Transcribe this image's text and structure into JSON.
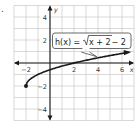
{
  "item_marker": ".",
  "chart_data": {
    "type": "line",
    "title": "",
    "function_label": {
      "lhs": "h(x) = ",
      "radicand": "x + 2",
      "rhs": " − 2"
    },
    "xlabel": "x",
    "ylabel": "y",
    "xlim": [
      -3,
      7
    ],
    "ylim": [
      -5,
      5
    ],
    "x_ticks": [
      {
        "value": -2,
        "label": "−2"
      },
      {
        "value": 2,
        "label": "2"
      },
      {
        "value": 4,
        "label": "4"
      },
      {
        "value": 6,
        "label": "6"
      }
    ],
    "y_ticks": [
      {
        "value": 4,
        "label": "4"
      },
      {
        "value": 2,
        "label": "2"
      },
      {
        "value": -2,
        "label": "−2"
      },
      {
        "value": -4,
        "label": "−4"
      }
    ],
    "grid": true,
    "series": [
      {
        "name": "h(x) = sqrt(x + 2) - 2",
        "start_point": [
          -2,
          -2
        ],
        "x": [
          -2,
          -1.75,
          -1.5,
          -1,
          -0.5,
          0,
          1,
          2,
          3,
          4,
          5,
          6,
          7
        ],
        "values": [
          -2,
          -1.5,
          -1.293,
          -1,
          -0.419,
          -0.586,
          -0.268,
          0,
          0.236,
          0.449,
          0.646,
          0.828,
          1.0
        ],
        "arrow_end": true,
        "color": "#1a1a1a"
      }
    ]
  }
}
